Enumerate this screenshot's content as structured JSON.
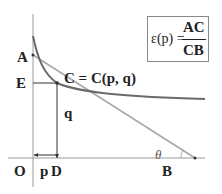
{
  "diagram": {
    "labels": {
      "A": "A",
      "E": "E",
      "C": "C = C(p, q)",
      "q": "q",
      "O": "O",
      "p": "p",
      "D": "D",
      "B": "B",
      "theta": "θ"
    },
    "formula": {
      "lhs": "ε(p) =",
      "numerator": "AC",
      "denominator": "CB"
    },
    "colors": {
      "curve": "#6a6a6a",
      "tangent": "#a8a8a8",
      "axes": "#9a9a9a",
      "guides": "#333333",
      "text": "#222222"
    }
  }
}
